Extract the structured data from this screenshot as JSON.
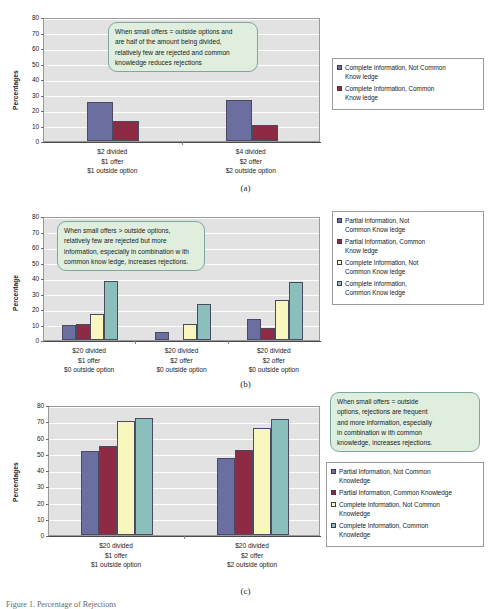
{
  "figure": {
    "subcaptions": [
      "(a)",
      "(b)",
      "(c)"
    ],
    "bottom_caption": "Figure 1. Percentage of Rejections",
    "colors": {
      "partial_not_common": "#6B6FA0",
      "partial_common": "#8E2A44",
      "complete_not_common": "#F8F7BE",
      "complete_common": "#8BBFBB",
      "plot_background": "#E2E2E2",
      "gridline": "#FFFFFF",
      "callout_fill": "#DFEEDD",
      "callout_border": "#7EA6A4"
    }
  },
  "chart_data": [
    {
      "id": "chart-a",
      "type": "bar",
      "title": "",
      "xlabel": "",
      "ylabel": "Percentages",
      "ylim": [
        0,
        80
      ],
      "yticks": [
        0,
        10,
        20,
        30,
        40,
        50,
        60,
        70,
        80
      ],
      "grid": true,
      "legend_position": "right",
      "categories": [
        "$2 divided\n$1 offer\n$1 outside option",
        "$4 divided\n$2 offer\n$2 outside option"
      ],
      "category_lines": [
        [
          "$2 divided",
          "$1 offer",
          "$1 outside option"
        ],
        [
          "$4 divided",
          "$2 offer",
          "$2 outside option"
        ]
      ],
      "series": [
        {
          "name": "Complete Information, Not Common Knowledge",
          "color": "#6B6FA0",
          "values": [
            25.3,
            26.2
          ]
        },
        {
          "name": "Complete Information, Common Knowledge",
          "color": "#8E2A44",
          "values": [
            13.0,
            10.3
          ]
        }
      ],
      "annotation": [
        "When small offers = outside options and",
        "are half of the amount being divided,",
        "relatively few  are rejected and common",
        "knowledge  reduces rejections"
      ]
    },
    {
      "id": "chart-b",
      "type": "bar",
      "title": "",
      "xlabel": "",
      "ylabel": "Percentage",
      "ylim": [
        0,
        80
      ],
      "yticks": [
        0,
        10,
        20,
        30,
        40,
        50,
        60,
        70,
        80
      ],
      "grid": true,
      "legend_position": "right",
      "categories": [
        "$20 divided\n$1 offer\n$0 outside option",
        "$20 divided\n$2 offer\n$0 outside option",
        "$20 divided\n$2 offer\n$0 outside option"
      ],
      "category_lines": [
        [
          "$20 divided",
          "$1 offer",
          "$0 outside option"
        ],
        [
          "$20 divided",
          "$2 offer",
          "$0 outside option"
        ],
        [
          "$20 divided",
          "$2 offer",
          "$0 outside option"
        ]
      ],
      "series": [
        {
          "name": "Partial Information, Not Common Knowledge",
          "color": "#6B6FA0",
          "values": [
            10.0,
            5.0,
            13.5
          ]
        },
        {
          "name": "Partial Information, Common Knowledge",
          "color": "#8E2A44",
          "values": [
            10.5,
            0,
            7.5
          ]
        },
        {
          "name": "Complete Information, Not Common Knowledge",
          "color": "#F8F7BE",
          "values": [
            17.0,
            10.5,
            26.0
          ]
        },
        {
          "name": "Complete Information, Common Knowledge",
          "color": "#8BBFBB",
          "values": [
            38.0,
            23.0,
            37.5
          ]
        }
      ],
      "annotation": [
        "When small offers > outside options,",
        "relatively few  are rejected but more",
        "information, especially in combination w ith",
        "common know ledge, increases rejections."
      ]
    },
    {
      "id": "chart-c",
      "type": "bar",
      "title": "",
      "xlabel": "",
      "ylabel": "Percentages",
      "ylim": [
        0,
        80
      ],
      "yticks": [
        0,
        10,
        20,
        30,
        40,
        50,
        60,
        70,
        80
      ],
      "grid": true,
      "legend_position": "right",
      "categories": [
        "$20 divided\n$1 offer\n$1 outside option",
        "$20 divided\n$2 offer\n$2 outside option"
      ],
      "category_lines": [
        [
          "$20 divided",
          "$1 offer",
          "$1 outside option"
        ],
        [
          "$20 divided",
          "$2 offer",
          "$2 outside option"
        ]
      ],
      "series": [
        {
          "name": "Partial Information, Not Common Knowledge",
          "color": "#6B6FA0",
          "values": [
            52.0,
            47.5
          ]
        },
        {
          "name": "Partial Information, Common Knowledge",
          "color": "#8E2A44",
          "values": [
            55.0,
            52.5
          ]
        },
        {
          "name": "Complete Information, Not Common Knowledge",
          "color": "#F8F7BE",
          "values": [
            70.3,
            66.0
          ]
        },
        {
          "name": "Complete Information, Common Knowledge",
          "color": "#8BBFBB",
          "values": [
            72.2,
            71.7
          ]
        }
      ],
      "annotation": [
        "When small offers = outside",
        "options, rejections are frequent",
        "and more information, especially",
        "in combination w ith common",
        "knowledge,  increases rejections."
      ]
    }
  ],
  "legends": {
    "chart_a": [
      {
        "label_lines": [
          "Complete Information, Not Common",
          "Know ledge"
        ],
        "color": "#6B6FA0"
      },
      {
        "label_lines": [
          "Complete Information, Common",
          "Know ledge"
        ],
        "color": "#8E2A44"
      }
    ],
    "chart_b": [
      {
        "label_lines": [
          "Partial Information, Not",
          "Common Know ledge"
        ],
        "color": "#6B6FA0"
      },
      {
        "label_lines": [
          "Partial Information, Common",
          "Know ledge"
        ],
        "color": "#8E2A44"
      },
      {
        "label_lines": [
          "Complete Information, Not",
          "Common Know ledge"
        ],
        "color": "#F8F7BE"
      },
      {
        "label_lines": [
          "Complete Information,",
          "Common Know ledge"
        ],
        "color": "#8BBFBB"
      }
    ],
    "chart_c": [
      {
        "label_lines": [
          "Partial Information, Not Common",
          "Knowledge"
        ],
        "color": "#6B6FA0"
      },
      {
        "label_lines": [
          "Partial Information, Common Knowledge"
        ],
        "color": "#8E2A44"
      },
      {
        "label_lines": [
          "Complete Information, Not Common",
          "Knowledge"
        ],
        "color": "#F8F7BE"
      },
      {
        "label_lines": [
          "Complete Information, Common",
          "Knowledge"
        ],
        "color": "#8BBFBB"
      }
    ]
  }
}
